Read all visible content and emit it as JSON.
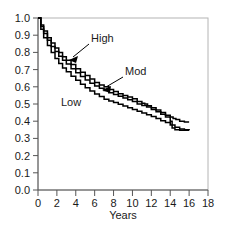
{
  "chart_data": {
    "type": "line",
    "title": "",
    "subtitle": "",
    "xlabel": "Years",
    "ylabel": "",
    "xlim": [
      0,
      18
    ],
    "ylim": [
      0,
      1.0
    ],
    "grid": false,
    "legend_position": "inline-annotations",
    "xticks": [
      0,
      2,
      4,
      6,
      8,
      10,
      12,
      14,
      16,
      18
    ],
    "xtick_labels": [
      "0",
      "2",
      "4",
      "6",
      "8",
      "10",
      "12",
      "14",
      "16",
      "18"
    ],
    "yticks": [
      0.0,
      0.1,
      0.2,
      0.3,
      0.4,
      0.5,
      0.6,
      0.7,
      0.8,
      0.9,
      1.0
    ],
    "ytick_labels": [
      "0.0",
      "0.1",
      "0.2",
      "0.3",
      "0.4",
      "0.5",
      "0.6",
      "0.7",
      "0.8",
      "0.9",
      "1.0"
    ],
    "annotations": [
      {
        "text": "High",
        "target_series": "High",
        "has_arrow": true
      },
      {
        "text": "Mod",
        "target_series": "Mod",
        "has_arrow": true
      },
      {
        "text": "Low",
        "target_series": "Low",
        "has_arrow": false
      }
    ],
    "series": [
      {
        "name": "High",
        "x": [
          0,
          0.3,
          0.6,
          1.0,
          1.4,
          1.8,
          2.2,
          2.6,
          3.0,
          3.5,
          4.0,
          4.5,
          5.0,
          5.5,
          6.0,
          6.5,
          7.0,
          7.5,
          8.0,
          8.5,
          9.0,
          9.5,
          10.0,
          10.5,
          11.0,
          11.3,
          11.6,
          12.0,
          12.5,
          13.0,
          13.5,
          14.0,
          14.3,
          14.6,
          15.0,
          15.5,
          16.0
        ],
        "values": [
          1.0,
          0.96,
          0.925,
          0.885,
          0.855,
          0.825,
          0.8,
          0.775,
          0.755,
          0.73,
          0.705,
          0.685,
          0.665,
          0.645,
          0.625,
          0.61,
          0.6,
          0.585,
          0.572,
          0.56,
          0.55,
          0.54,
          0.53,
          0.515,
          0.505,
          0.5,
          0.49,
          0.478,
          0.465,
          0.45,
          0.435,
          0.425,
          0.415,
          0.41,
          0.4,
          0.395,
          0.395
        ]
      },
      {
        "name": "Mod",
        "x": [
          0,
          0.3,
          0.6,
          1.0,
          1.4,
          1.8,
          2.2,
          2.6,
          3.0,
          3.5,
          4.0,
          4.5,
          5.0,
          5.5,
          6.0,
          6.5,
          7.0,
          7.5,
          8.0,
          8.5,
          9.0,
          9.5,
          10.0,
          10.5,
          11.0,
          11.5,
          12.0,
          12.5,
          13.0,
          13.5,
          14.0,
          14.2,
          14.5,
          15.0,
          15.5,
          16.0
        ],
        "values": [
          1.0,
          0.95,
          0.91,
          0.87,
          0.835,
          0.805,
          0.778,
          0.755,
          0.732,
          0.705,
          0.682,
          0.66,
          0.64,
          0.62,
          0.605,
          0.592,
          0.578,
          0.565,
          0.555,
          0.545,
          0.535,
          0.525,
          0.515,
          0.5,
          0.492,
          0.482,
          0.468,
          0.455,
          0.44,
          0.425,
          0.4,
          0.36,
          0.35,
          0.348,
          0.348,
          0.348
        ]
      },
      {
        "name": "Low",
        "x": [
          0,
          0.3,
          0.6,
          1.0,
          1.4,
          1.8,
          2.2,
          2.6,
          3.0,
          3.5,
          4.0,
          4.5,
          5.0,
          5.5,
          6.0,
          6.5,
          7.0,
          7.5,
          8.0,
          8.5,
          9.0,
          9.5,
          10.0,
          10.5,
          11.0,
          11.5,
          12.0,
          12.5,
          13.0,
          13.5,
          14.0,
          14.5,
          15.0,
          15.5,
          16.0
        ],
        "values": [
          1.0,
          0.935,
          0.885,
          0.84,
          0.8,
          0.765,
          0.735,
          0.71,
          0.688,
          0.662,
          0.638,
          0.615,
          0.595,
          0.575,
          0.558,
          0.543,
          0.528,
          0.518,
          0.508,
          0.498,
          0.488,
          0.478,
          0.468,
          0.458,
          0.448,
          0.438,
          0.428,
          0.415,
          0.403,
          0.392,
          0.378,
          0.365,
          0.355,
          0.35,
          0.348
        ]
      }
    ]
  },
  "axis": {
    "x_title": "Years"
  },
  "labels": {
    "high": "High",
    "mod": "Mod",
    "low": "Low"
  }
}
